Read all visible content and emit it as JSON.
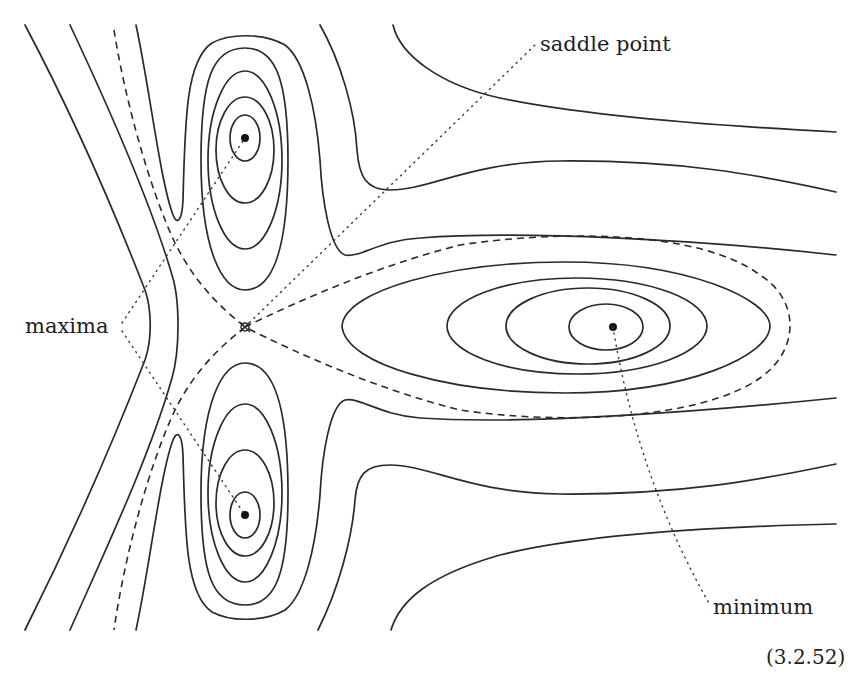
{
  "figure": {
    "type": "contour-plot",
    "labels": {
      "saddle_point": "saddle point",
      "maxima": "maxima",
      "minimum": "minimum",
      "equation_number": "(3.2.52)"
    },
    "critical_points": [
      {
        "kind": "maximum",
        "x": 245,
        "y": 138,
        "marker": "filled-dot"
      },
      {
        "kind": "maximum",
        "x": 245,
        "y": 515,
        "marker": "filled-dot"
      },
      {
        "kind": "saddle",
        "x": 245,
        "y": 327,
        "marker": "circled-x"
      },
      {
        "kind": "minimum",
        "x": 613,
        "y": 327,
        "marker": "filled-dot"
      }
    ],
    "line_styles": {
      "contour": "solid",
      "separatrix": "dashed",
      "leader": "dotted"
    },
    "colors": {
      "ink": "#2a2a2a",
      "background": "#ffffff"
    }
  }
}
